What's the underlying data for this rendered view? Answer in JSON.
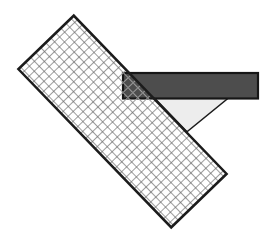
{
  "figure": {
    "name": "overlapping-shapes-geometry-figure",
    "canvas": {
      "width": 264,
      "height": 240,
      "background": "#ffffff"
    },
    "z_order": [
      "light_triangle",
      "dark_bar",
      "grid_strip"
    ],
    "grid_strip": {
      "center_x": 122.5,
      "center_y": 121.5,
      "length": 220,
      "width": 77,
      "rotation_deg": 46,
      "cell_size": 7,
      "line_color": "#9d9d9d",
      "line_width": 1,
      "dot_color": "#7d7d7d",
      "dot_size": 1.5,
      "border_color": "#1c1c1c",
      "border_width": 2.5,
      "fill": "none"
    },
    "dark_bar": {
      "x": 123,
      "y": 73,
      "width": 135,
      "height": 25.5,
      "fill": "#4d4d4d",
      "border_color": "#161616",
      "border_width": 2.2
    },
    "light_triangle": {
      "points": [
        [
          154,
          97.5
        ],
        [
          229,
          97.5
        ],
        [
          187,
          131.8
        ]
      ],
      "fill": "#ededed",
      "border_color": "#1c1c1c",
      "border_width": 1.5
    }
  }
}
